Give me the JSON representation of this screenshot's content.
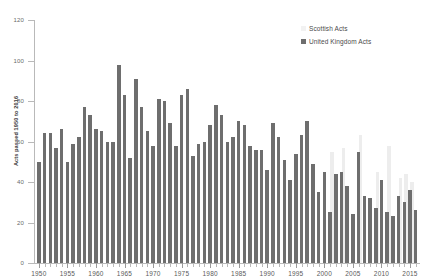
{
  "chart_data": {
    "type": "bar",
    "title": "",
    "subtitle": "",
    "xlabel": "",
    "ylabel": "Acts passed 1950 to 2016",
    "ylim": [
      0,
      120
    ],
    "yticks": [
      0,
      20,
      40,
      60,
      80,
      100,
      120
    ],
    "xlim": [
      1949.5,
      2016.5
    ],
    "xticks": [
      1950,
      1955,
      1960,
      1965,
      1970,
      1975,
      1980,
      1985,
      1990,
      1995,
      2000,
      2005,
      2010,
      2015
    ],
    "grid": false,
    "legend_position": "top-right",
    "legend": [
      {
        "name": "Scottish Acts",
        "color": "#f2f2f2"
      },
      {
        "name": "United Kingdom Acts",
        "color": "#6e6e6e"
      }
    ],
    "categories": [
      1950,
      1951,
      1952,
      1953,
      1954,
      1955,
      1956,
      1957,
      1958,
      1959,
      1960,
      1961,
      1962,
      1963,
      1964,
      1965,
      1966,
      1967,
      1968,
      1969,
      1970,
      1971,
      1972,
      1973,
      1974,
      1975,
      1976,
      1977,
      1978,
      1979,
      1980,
      1981,
      1982,
      1983,
      1984,
      1985,
      1986,
      1987,
      1988,
      1989,
      1990,
      1991,
      1992,
      1993,
      1994,
      1995,
      1996,
      1997,
      1998,
      1999,
      2000,
      2001,
      2002,
      2003,
      2004,
      2005,
      2006,
      2007,
      2008,
      2009,
      2010,
      2011,
      2012,
      2013,
      2014,
      2015,
      2016
    ],
    "series": [
      {
        "name": "United Kingdom Acts",
        "color": "#6e6e6e",
        "values": [
          50,
          64,
          64,
          57,
          66,
          50,
          59,
          62,
          77,
          73,
          66,
          65,
          60,
          60,
          98,
          83,
          52,
          91,
          77,
          65,
          58,
          81,
          80,
          69,
          58,
          83,
          86,
          53,
          59,
          60,
          68,
          78,
          73,
          60,
          62,
          70,
          68,
          58,
          56,
          56,
          46,
          69,
          62,
          51,
          41,
          54,
          63,
          70,
          49,
          35,
          45,
          25,
          44,
          45,
          38,
          24,
          55,
          33,
          32,
          27,
          41,
          25,
          23,
          33,
          30,
          36,
          26
        ]
      },
      {
        "name": "Scottish Acts",
        "color": "#ededed",
        "values": [
          0,
          0,
          0,
          0,
          0,
          0,
          0,
          0,
          0,
          0,
          0,
          0,
          0,
          0,
          0,
          0,
          0,
          0,
          0,
          0,
          0,
          0,
          0,
          0,
          0,
          0,
          0,
          0,
          0,
          0,
          0,
          0,
          0,
          0,
          0,
          0,
          0,
          0,
          0,
          0,
          0,
          0,
          0,
          0,
          0,
          0,
          0,
          0,
          0,
          0,
          0,
          55,
          0,
          57,
          0,
          0,
          63,
          0,
          0,
          45,
          0,
          58,
          0,
          42,
          44,
          40,
          0
        ]
      }
    ]
  }
}
